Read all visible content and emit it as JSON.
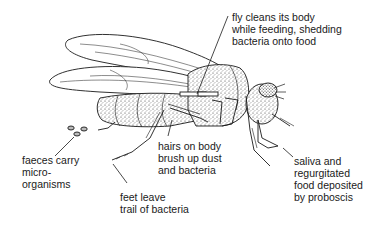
{
  "diagram": {
    "labels": {
      "cleaning": {
        "lines": [
          "fly cleans its body",
          "while feeding, shedding",
          "bacteria onto food"
        ]
      },
      "hairs": {
        "lines": [
          "hairs on body",
          "brush up dust",
          "and bacteria"
        ]
      },
      "faeces": {
        "lines": [
          "faeces carry",
          "micro-",
          "organisms"
        ]
      },
      "feet": {
        "lines": [
          "feet leave",
          "trail of bacteria"
        ]
      },
      "saliva": {
        "lines": [
          "saliva and",
          "regurgitated",
          "food deposited",
          "by proboscis"
        ]
      }
    },
    "colors": {
      "ink": "#1a1a1a",
      "stipple": "#555555",
      "background": "#ffffff"
    }
  }
}
